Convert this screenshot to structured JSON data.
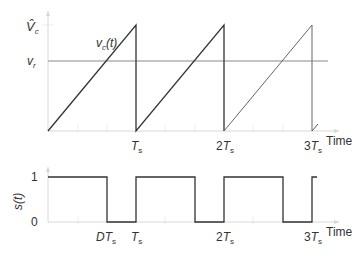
{
  "top_plot": {
    "y_labels": {
      "peak": "V̂",
      "peak_sub": "c",
      "ref": "v",
      "ref_sub": "r"
    },
    "curve_label": {
      "main": "v",
      "sub": "c",
      "arg": "(t)"
    },
    "x_ticks": [
      {
        "coef": "",
        "sym": "T",
        "sub": "s"
      },
      {
        "coef": "2",
        "sym": "T",
        "sub": "s"
      },
      {
        "coef": "3",
        "sym": "T",
        "sub": "s"
      }
    ],
    "x_axis_label": "Time"
  },
  "bottom_plot": {
    "y_axis_label": "s(t)",
    "y_ticks": [
      "1",
      "0"
    ],
    "x_ticks": [
      {
        "coef": "D",
        "sym": "T",
        "sub": "s"
      },
      {
        "coef": "",
        "sym": "T",
        "sub": "s"
      },
      {
        "coef": "2",
        "sym": "T",
        "sub": "s"
      },
      {
        "coef": "3",
        "sym": "T",
        "sub": "s"
      }
    ],
    "x_axis_label": "Time"
  },
  "colors": {
    "waveform": "#333333",
    "reference": "#8a8a8a",
    "axis": "#d8d8d8",
    "grid": "#ececec"
  }
}
